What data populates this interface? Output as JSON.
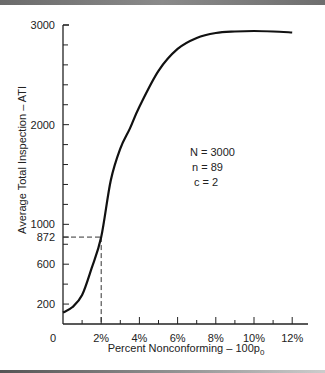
{
  "chart_data": {
    "type": "line",
    "title": "",
    "xlabel": "Percent Nonconforming – 100p",
    "xlabel_subscript": "0",
    "ylabel": "Average Total Inspection – ATI",
    "xlim": [
      0,
      12.5
    ],
    "ylim": [
      0,
      3000
    ],
    "grid": false,
    "x_ticks": [
      {
        "value": 0,
        "label": "0"
      },
      {
        "value": 2,
        "label": "2%"
      },
      {
        "value": 4,
        "label": "4%"
      },
      {
        "value": 6,
        "label": "6%"
      },
      {
        "value": 8,
        "label": "8%"
      },
      {
        "value": 10,
        "label": "10%"
      },
      {
        "value": 12,
        "label": "12%"
      }
    ],
    "x_minor_ticks": [
      1,
      3,
      5,
      7,
      9,
      11
    ],
    "y_ticks": [
      {
        "value": 200,
        "label": "200"
      },
      {
        "value": 600,
        "label": "600"
      },
      {
        "value": 872,
        "label": "872"
      },
      {
        "value": 1000,
        "label": "1000"
      },
      {
        "value": 2000,
        "label": "2000"
      },
      {
        "value": 3000,
        "label": "3000"
      }
    ],
    "y_minor_ticks": [
      400,
      800,
      1200,
      1400,
      1600,
      1800,
      2200,
      2400,
      2600,
      2800
    ],
    "series": [
      {
        "name": "ATI curve",
        "x": [
          0,
          0.5,
          1,
          1.5,
          2,
          2.5,
          3,
          3.5,
          4,
          5,
          6,
          7,
          8,
          9,
          10,
          11,
          12
        ],
        "y": [
          115,
          170,
          290,
          560,
          872,
          1440,
          1760,
          1960,
          2180,
          2540,
          2760,
          2870,
          2920,
          2935,
          2940,
          2935,
          2925
        ]
      }
    ],
    "reference_point": {
      "x": 2,
      "y": 872,
      "style": "dashed"
    },
    "annotations": [
      "N = 3000",
      "n = 89",
      "c = 2"
    ]
  }
}
